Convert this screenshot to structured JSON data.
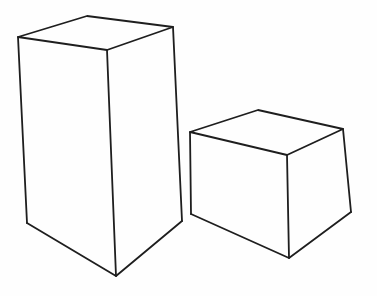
{
  "drawing": {
    "description": "Hand-drawn line sketch of two rectangular boxes",
    "stroke_color": "#1e1e1e",
    "background_color": "#fefefe",
    "shapes": [
      {
        "name": "tall-box",
        "paths": [
          "M18,37 L87,16 L173,27 L107,50 Z",
          "M18,37 L27,223",
          "M107,50 L116,276",
          "M173,27 L182,221",
          "M27,223 L116,276 L182,221"
        ]
      },
      {
        "name": "short-box",
        "paths": [
          "M190,132 L258,110 L343,129 L287,155 Z",
          "M190,132 L191,214",
          "M287,155 L289,258",
          "M343,129 L351,212",
          "M191,214 L289,258 L351,212"
        ]
      }
    ]
  }
}
